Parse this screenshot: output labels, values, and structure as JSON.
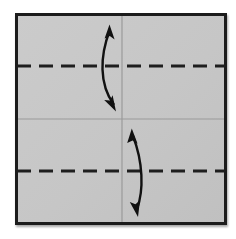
{
  "canvas": {
    "width": 236,
    "height": 239,
    "background_color": "#ffffff",
    "title": "Origami fold step diagram"
  },
  "diagram": {
    "type": "origami-fold-instruction",
    "paper": {
      "name": "square-paper",
      "shape": "square",
      "x": 15,
      "y": 13,
      "width": 212,
      "height": 212,
      "fill_color": "#c6c6c6",
      "border_color": "#1e1e1e",
      "border_width": 3
    },
    "creases": [
      {
        "name": "horizontal-center-crease",
        "orientation": "horizontal",
        "style": "solid",
        "y": 119,
        "x1": 16,
        "x2": 226,
        "color": "#9a9a9a",
        "stroke_width": 1.2,
        "meaning": "existing valley crease at 1/2 height"
      },
      {
        "name": "vertical-center-crease",
        "orientation": "vertical",
        "style": "solid",
        "x": 122,
        "y1": 14,
        "y2": 224,
        "color": "#9a9a9a",
        "stroke_width": 1.2,
        "meaning": "existing crease at 1/2 width"
      },
      {
        "name": "upper-quarter-fold-line",
        "orientation": "horizontal",
        "style": "dashed",
        "y": 66,
        "x1": 16,
        "x2": 226,
        "color": "#1e1e1e",
        "stroke_width": 3,
        "dash_length": 14,
        "gap_length": 8,
        "meaning": "fold line at 1/4 height"
      },
      {
        "name": "lower-quarter-fold-line",
        "orientation": "horizontal",
        "style": "dashed",
        "y": 171,
        "x1": 16,
        "x2": 226,
        "color": "#1e1e1e",
        "stroke_width": 3,
        "dash_length": 14,
        "gap_length": 8,
        "meaning": "fold line at 3/4 height"
      }
    ],
    "arrows": [
      {
        "name": "upper-fold-arrow",
        "kind": "double-headed-curved-arrow",
        "color": "#111111",
        "stroke_width": 2.4,
        "start": {
          "x": 109,
          "y": 29
        },
        "control": {
          "x": 99,
          "y": 72
        },
        "end": {
          "x": 114,
          "y": 105
        },
        "head_start": {
          "x": 109,
          "y": 25,
          "direction": "up"
        },
        "head_end": {
          "x": 115,
          "y": 110,
          "direction": "down"
        },
        "meaning": "top edge folds down to the upper quarter crease"
      },
      {
        "name": "lower-fold-arrow",
        "kind": "double-headed-curved-arrow",
        "color": "#111111",
        "stroke_width": 2.4,
        "start": {
          "x": 132,
          "y": 133
        },
        "control": {
          "x": 143,
          "y": 172
        },
        "end": {
          "x": 137,
          "y": 211
        },
        "head_start": {
          "x": 132,
          "y": 129,
          "direction": "up"
        },
        "head_end": {
          "x": 138,
          "y": 216,
          "direction": "down"
        },
        "meaning": "bottom edge folds up to the lower quarter crease"
      }
    ],
    "colors": {
      "paper_fill": "#c6c6c6",
      "paper_border": "#1e1e1e",
      "fold_line": "#1e1e1e",
      "soft_crease": "#9a9a9a",
      "arrow": "#111111",
      "background": "#ffffff"
    }
  }
}
